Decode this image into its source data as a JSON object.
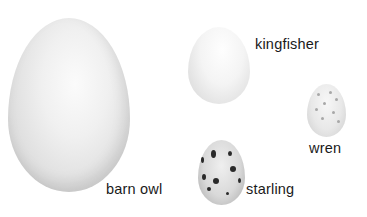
{
  "diagram": {
    "type": "egg size comparison",
    "eggs": [
      {
        "id": "barn-owl",
        "label": "barn owl",
        "color": "#e8e8e8",
        "pattern": "plain"
      },
      {
        "id": "kingfisher",
        "label": "kingfisher",
        "color": "#f2f2f2",
        "pattern": "plain"
      },
      {
        "id": "wren",
        "label": "wren",
        "color": "#e6e6e6",
        "pattern": "fine speckles"
      },
      {
        "id": "starling",
        "label": "starling",
        "color": "#d6d6d6",
        "pattern": "dark spots"
      }
    ]
  }
}
